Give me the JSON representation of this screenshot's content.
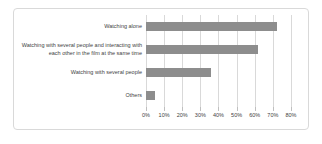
{
  "chart_data": {
    "type": "bar",
    "orientation": "horizontal",
    "title": "",
    "xlabel": "",
    "ylabel": "",
    "unit": "%",
    "categories": [
      "Watching alone",
      "Watching with several people and interacting with each other in the film at the same time",
      "Watching with several people",
      "Others"
    ],
    "values": [
      72,
      62,
      36,
      5
    ],
    "xlim": [
      0,
      80
    ],
    "tick_labels": [
      "0%",
      "10%",
      "20%",
      "30%",
      "40%",
      "50%",
      "60%",
      "70%",
      "80%"
    ],
    "grid": "vertical",
    "legend": "none",
    "colors": {
      "bar": "#8d8d8d",
      "gridline": "#d9d9d9",
      "text": "#3f3f3f",
      "card_border": "#d9d9d9",
      "background": "#ffffff"
    }
  }
}
